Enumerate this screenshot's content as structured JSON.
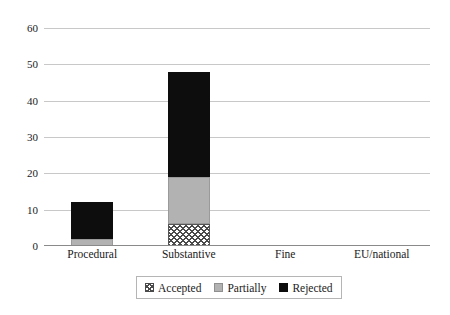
{
  "chart_data": {
    "type": "bar",
    "stacked": true,
    "title": "",
    "xlabel": "",
    "ylabel": "",
    "categories": [
      "Procedural",
      "Substantive",
      "Fine",
      "EU/national"
    ],
    "series": [
      {
        "name": "Accepted",
        "values": [
          0,
          6,
          0,
          0
        ],
        "color": "#ffffff",
        "pattern": "crosshatch"
      },
      {
        "name": "Partially",
        "values": [
          2,
          13,
          0,
          0
        ],
        "color": "#b2b2b2",
        "pattern": "solid"
      },
      {
        "name": "Rejected",
        "values": [
          10,
          29,
          0,
          0
        ],
        "color": "#0d0d0d",
        "pattern": "solid"
      }
    ],
    "totals": [
      12,
      48,
      0,
      0
    ],
    "ylim": [
      0,
      60
    ],
    "yticks": [
      0,
      10,
      20,
      30,
      40,
      50,
      60
    ],
    "ytick_labels": [
      "0",
      "10",
      "20",
      "30",
      "40",
      "50",
      "60"
    ],
    "grid": true,
    "legend_position": "bottom"
  },
  "legend": {
    "items": [
      {
        "label": "Accepted"
      },
      {
        "label": "Partially"
      },
      {
        "label": "Rejected"
      }
    ]
  }
}
